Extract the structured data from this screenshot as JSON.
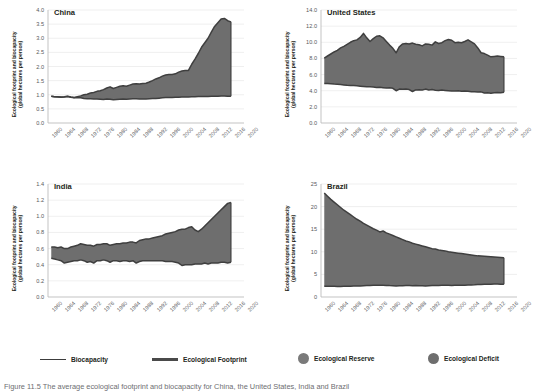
{
  "figure": {
    "ylabel": "Ecological footprint and biocapacity\n(global hectares per person)",
    "ylabel_line1": "Ecological footprint and biocapacity",
    "ylabel_line2": "(global hectares per person)",
    "caption": "Figure 11.5   The average ecological footprint and biocapacity for China, the United States, India and Brazil"
  },
  "legend": {
    "position": "bottom",
    "items": [
      {
        "label": "Biocapacity",
        "marker": "line-thin",
        "color": "#3c3c3c"
      },
      {
        "label": "Ecological Footprint",
        "marker": "line-thick",
        "color": "#4a4a4a"
      },
      {
        "label": "Ecological Reserve",
        "marker": "circle",
        "color": "#7a7a7a"
      },
      {
        "label": "Ecological Deficit",
        "marker": "circle",
        "color": "#6e6e6e"
      }
    ]
  },
  "colors": {
    "fill": "#6e6e6e",
    "footprint_line": "#3f3f3f",
    "biocapacity_line": "#3f3f3f",
    "axis": "#bcbcbc",
    "gridline": "#e8e8e8",
    "tick_text": "#58595b",
    "title_text": "#231f20"
  },
  "chart_data": [
    {
      "type": "area",
      "title": "China",
      "xlabel": "",
      "ylabel": "Ecological footprint and biocapacity (global hectares per person)",
      "xlim": [
        1960,
        2020
      ],
      "ylim": [
        0.0,
        4.0
      ],
      "yticks": [
        "0.0",
        "0.5",
        "1.0",
        "1.5",
        "2.0",
        "2.5",
        "3.0",
        "3.5",
        "4.0"
      ],
      "xticks": [
        "1960",
        "1964",
        "1968",
        "1972",
        "1976",
        "1980",
        "1984",
        "1988",
        "1992",
        "1996",
        "2000",
        "2004",
        "2008",
        "2012",
        "2016",
        "2020"
      ],
      "grid": true,
      "band": "deficit",
      "x": [
        1961,
        1962,
        1963,
        1964,
        1965,
        1966,
        1967,
        1968,
        1969,
        1970,
        1971,
        1972,
        1973,
        1974,
        1975,
        1976,
        1977,
        1978,
        1979,
        1980,
        1981,
        1982,
        1983,
        1984,
        1985,
        1986,
        1987,
        1988,
        1989,
        1990,
        1991,
        1992,
        1993,
        1994,
        1995,
        1996,
        1997,
        1998,
        1999,
        2000,
        2001,
        2002,
        2003,
        2004,
        2005,
        2006,
        2007,
        2008,
        2009,
        2010,
        2011,
        2012,
        2013,
        2014,
        2015,
        2016
      ],
      "series": [
        {
          "name": "Ecological Footprint",
          "values": [
            0.95,
            0.93,
            0.93,
            0.92,
            0.93,
            0.95,
            0.92,
            0.9,
            0.93,
            0.96,
            1.0,
            1.02,
            1.06,
            1.08,
            1.12,
            1.14,
            1.18,
            1.24,
            1.28,
            1.22,
            1.26,
            1.3,
            1.32,
            1.3,
            1.34,
            1.38,
            1.39,
            1.38,
            1.4,
            1.41,
            1.45,
            1.5,
            1.56,
            1.6,
            1.66,
            1.7,
            1.72,
            1.72,
            1.74,
            1.8,
            1.84,
            1.86,
            1.86,
            2.08,
            2.26,
            2.46,
            2.68,
            2.84,
            3.0,
            3.22,
            3.42,
            3.55,
            3.68,
            3.7,
            3.62,
            3.58
          ]
        },
        {
          "name": "Biocapacity",
          "values": [
            0.95,
            0.93,
            0.92,
            0.91,
            0.92,
            0.94,
            0.91,
            0.89,
            0.9,
            0.89,
            0.87,
            0.86,
            0.86,
            0.85,
            0.85,
            0.84,
            0.83,
            0.85,
            0.84,
            0.82,
            0.83,
            0.84,
            0.85,
            0.84,
            0.85,
            0.86,
            0.86,
            0.85,
            0.85,
            0.85,
            0.86,
            0.87,
            0.87,
            0.88,
            0.89,
            0.9,
            0.9,
            0.9,
            0.91,
            0.91,
            0.92,
            0.92,
            0.92,
            0.93,
            0.93,
            0.94,
            0.94,
            0.94,
            0.94,
            0.95,
            0.95,
            0.95,
            0.96,
            0.96,
            0.95,
            0.95
          ]
        }
      ]
    },
    {
      "type": "area",
      "title": "United States",
      "xlabel": "",
      "ylabel": "Ecological footprint and biocapacity (global hectares per person)",
      "xlim": [
        1960,
        2020
      ],
      "ylim": [
        0.0,
        14.0
      ],
      "yticks": [
        "0.0",
        "2.0",
        "4.0",
        "6.0",
        "8.0",
        "10.0",
        "12.0",
        "14.0"
      ],
      "xticks": [
        "1960",
        "1964",
        "1968",
        "1972",
        "1976",
        "1980",
        "1984",
        "1988",
        "1992",
        "1996",
        "2000",
        "2004",
        "2008",
        "2012",
        "2016",
        "2020"
      ],
      "grid": true,
      "band": "deficit",
      "x": [
        1961,
        1962,
        1963,
        1964,
        1965,
        1966,
        1967,
        1968,
        1969,
        1970,
        1971,
        1972,
        1973,
        1974,
        1975,
        1976,
        1977,
        1978,
        1979,
        1980,
        1981,
        1982,
        1983,
        1984,
        1985,
        1986,
        1987,
        1988,
        1989,
        1990,
        1991,
        1992,
        1993,
        1994,
        1995,
        1996,
        1997,
        1998,
        1999,
        2000,
        2001,
        2002,
        2003,
        2004,
        2005,
        2006,
        2007,
        2008,
        2009,
        2010,
        2011,
        2012,
        2013,
        2014,
        2015,
        2016
      ],
      "series": [
        {
          "name": "Ecological Footprint",
          "values": [
            8.05,
            8.3,
            8.55,
            8.8,
            9.0,
            9.3,
            9.5,
            9.75,
            10.0,
            10.2,
            10.3,
            10.6,
            11.1,
            10.55,
            10.1,
            10.45,
            10.75,
            10.8,
            10.55,
            10.1,
            9.65,
            9.25,
            8.7,
            9.45,
            9.8,
            9.85,
            9.8,
            9.9,
            9.75,
            9.7,
            9.55,
            9.8,
            9.75,
            9.65,
            10.05,
            9.85,
            9.95,
            10.2,
            10.35,
            10.25,
            9.95,
            10.0,
            9.95,
            10.1,
            10.3,
            10.05,
            9.8,
            9.3,
            8.7,
            8.6,
            8.4,
            8.2,
            8.25,
            8.3,
            8.25,
            8.2
          ]
        },
        {
          "name": "Biocapacity",
          "values": [
            4.9,
            4.88,
            4.85,
            4.82,
            4.8,
            4.76,
            4.72,
            4.68,
            4.66,
            4.64,
            4.6,
            4.56,
            4.52,
            4.48,
            4.5,
            4.46,
            4.4,
            4.42,
            4.38,
            4.34,
            4.36,
            4.3,
            4.0,
            4.2,
            4.18,
            4.22,
            4.14,
            3.9,
            4.1,
            4.12,
            4.08,
            4.2,
            4.1,
            4.14,
            4.06,
            4.02,
            4.08,
            4.04,
            4.0,
            3.96,
            3.98,
            4.0,
            3.94,
            3.96,
            3.92,
            3.88,
            3.86,
            3.84,
            3.86,
            3.72,
            3.74,
            3.7,
            3.76,
            3.78,
            3.74,
            3.82
          ]
        }
      ]
    },
    {
      "type": "area",
      "title": "India",
      "xlabel": "",
      "ylabel": "Ecological footprint and biocapacity (global hectares per person)",
      "xlim": [
        1960,
        2020
      ],
      "ylim": [
        0.0,
        1.4
      ],
      "yticks": [
        "0.0",
        "0.2",
        "0.4",
        "0.6",
        "0.8",
        "1.0",
        "1.2",
        "1.4"
      ],
      "xticks": [
        "1960",
        "1964",
        "1968",
        "1972",
        "1976",
        "1980",
        "1984",
        "1988",
        "1992",
        "1996",
        "2000",
        "2004",
        "2008",
        "2012",
        "2016",
        "2020"
      ],
      "grid": true,
      "band": "deficit",
      "x": [
        1961,
        1962,
        1963,
        1964,
        1965,
        1966,
        1967,
        1968,
        1969,
        1970,
        1971,
        1972,
        1973,
        1974,
        1975,
        1976,
        1977,
        1978,
        1979,
        1980,
        1981,
        1982,
        1983,
        1984,
        1985,
        1986,
        1987,
        1988,
        1989,
        1990,
        1991,
        1992,
        1993,
        1994,
        1995,
        1996,
        1997,
        1998,
        1999,
        2000,
        2001,
        2002,
        2003,
        2004,
        2005,
        2006,
        2007,
        2008,
        2009,
        2010,
        2011,
        2012,
        2013,
        2014,
        2015,
        2016
      ],
      "series": [
        {
          "name": "Ecological Footprint",
          "values": [
            0.62,
            0.62,
            0.61,
            0.62,
            0.6,
            0.6,
            0.62,
            0.63,
            0.64,
            0.66,
            0.65,
            0.64,
            0.64,
            0.63,
            0.65,
            0.65,
            0.66,
            0.66,
            0.64,
            0.65,
            0.66,
            0.66,
            0.67,
            0.67,
            0.68,
            0.68,
            0.67,
            0.7,
            0.71,
            0.72,
            0.72,
            0.73,
            0.74,
            0.75,
            0.76,
            0.78,
            0.79,
            0.8,
            0.81,
            0.83,
            0.84,
            0.84,
            0.86,
            0.87,
            0.83,
            0.81,
            0.84,
            0.88,
            0.92,
            0.96,
            1.0,
            1.04,
            1.08,
            1.12,
            1.16,
            1.17
          ]
        },
        {
          "name": "Biocapacity",
          "values": [
            0.48,
            0.47,
            0.46,
            0.45,
            0.42,
            0.43,
            0.44,
            0.45,
            0.45,
            0.46,
            0.45,
            0.43,
            0.44,
            0.42,
            0.45,
            0.45,
            0.46,
            0.45,
            0.43,
            0.45,
            0.45,
            0.44,
            0.45,
            0.45,
            0.44,
            0.45,
            0.42,
            0.44,
            0.45,
            0.45,
            0.45,
            0.45,
            0.45,
            0.45,
            0.45,
            0.44,
            0.44,
            0.44,
            0.43,
            0.42,
            0.39,
            0.4,
            0.4,
            0.4,
            0.41,
            0.41,
            0.41,
            0.42,
            0.41,
            0.42,
            0.42,
            0.42,
            0.43,
            0.43,
            0.42,
            0.43
          ]
        }
      ]
    },
    {
      "type": "area",
      "title": "Brazil",
      "xlabel": "",
      "ylabel": "Ecological footprint and biocapacity (global hectares per person)",
      "xlim": [
        1960,
        2020
      ],
      "ylim": [
        0,
        25
      ],
      "yticks": [
        "0",
        "5",
        "10",
        "15",
        "20",
        "25"
      ],
      "xticks": [
        "1960",
        "1964",
        "1968",
        "1972",
        "1976",
        "1980",
        "1984",
        "1988",
        "1992",
        "1996",
        "2000",
        "2004",
        "2008",
        "2012",
        "2016",
        "2020"
      ],
      "grid": true,
      "band": "reserve",
      "x": [
        1961,
        1962,
        1963,
        1964,
        1965,
        1966,
        1967,
        1968,
        1969,
        1970,
        1971,
        1972,
        1973,
        1974,
        1975,
        1976,
        1977,
        1978,
        1979,
        1980,
        1981,
        1982,
        1983,
        1984,
        1985,
        1986,
        1987,
        1988,
        1989,
        1990,
        1991,
        1992,
        1993,
        1994,
        1995,
        1996,
        1997,
        1998,
        1999,
        2000,
        2001,
        2002,
        2003,
        2004,
        2005,
        2006,
        2007,
        2008,
        2009,
        2010,
        2011,
        2012,
        2013,
        2014,
        2015,
        2016
      ],
      "series": [
        {
          "name": "Biocapacity",
          "values": [
            23.0,
            22.3,
            21.6,
            21.0,
            20.4,
            19.8,
            19.2,
            18.7,
            18.2,
            17.7,
            17.2,
            16.8,
            16.3,
            15.9,
            15.5,
            15.1,
            14.8,
            14.4,
            14.6,
            14.2,
            13.9,
            13.6,
            13.3,
            13.0,
            12.7,
            12.4,
            12.2,
            11.9,
            11.7,
            11.5,
            11.3,
            11.1,
            10.9,
            10.7,
            10.6,
            10.4,
            10.3,
            10.2,
            10.0,
            9.9,
            9.8,
            9.7,
            9.6,
            9.5,
            9.4,
            9.3,
            9.2,
            9.1,
            9.05,
            9.0,
            8.95,
            8.9,
            8.85,
            8.8,
            8.75,
            8.7
          ]
        },
        {
          "name": "Ecological Footprint",
          "values": [
            2.4,
            2.38,
            2.36,
            2.36,
            2.35,
            2.34,
            2.36,
            2.38,
            2.4,
            2.42,
            2.44,
            2.46,
            2.5,
            2.52,
            2.54,
            2.58,
            2.6,
            2.62,
            2.6,
            2.56,
            2.52,
            2.5,
            2.46,
            2.48,
            2.5,
            2.54,
            2.52,
            2.5,
            2.52,
            2.5,
            2.48,
            2.46,
            2.5,
            2.52,
            2.54,
            2.56,
            2.58,
            2.6,
            2.58,
            2.56,
            2.58,
            2.6,
            2.58,
            2.62,
            2.64,
            2.66,
            2.7,
            2.76,
            2.74,
            2.8,
            2.82,
            2.84,
            2.86,
            2.88,
            2.84,
            2.8
          ]
        }
      ]
    }
  ]
}
